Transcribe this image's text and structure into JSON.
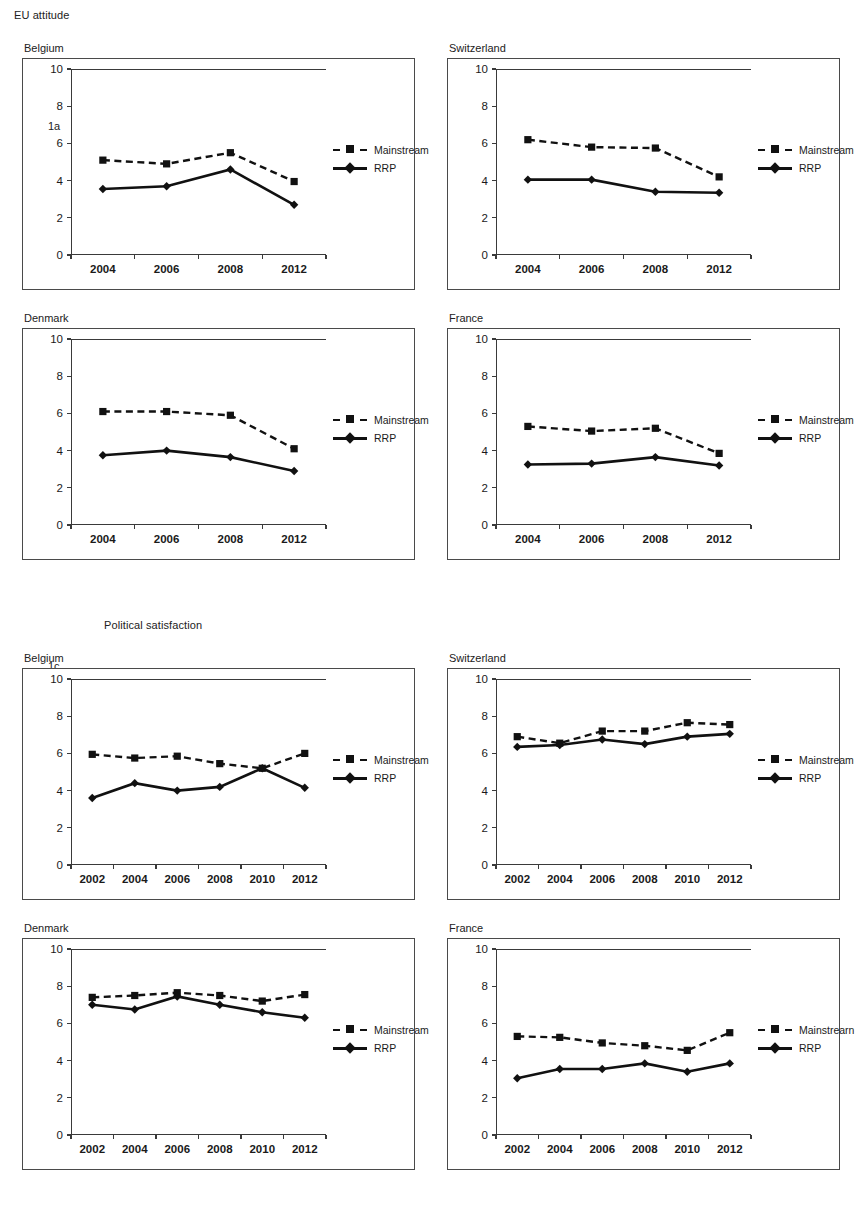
{
  "sections": [
    {
      "id": "eu-attitude",
      "title": "EU attitude"
    },
    {
      "id": "political-satisfaction",
      "title": "Political satisfaction"
    }
  ],
  "legend": {
    "mainstream_label": "Mainstream",
    "rrp_label": "RRP",
    "mainstream_label_variant": "Mainstrearn"
  },
  "axis": {
    "yticks": [
      "0",
      "2",
      "4",
      "6",
      "8",
      "10"
    ],
    "ymin": 0,
    "ymax": 10,
    "years_4": [
      "2004",
      "2006",
      "2008",
      "2012"
    ],
    "years_6": [
      "2002",
      "2004",
      "2006",
      "2008",
      "2010",
      "2012"
    ]
  },
  "panels": [
    {
      "tag": "1a",
      "country": "Belgium",
      "section": "EU attitude"
    },
    {
      "tag": "1b",
      "country": "Switzerland",
      "section": "EU attitude"
    },
    {
      "tag": "1c",
      "country": "Denmark",
      "section": "EU attitude"
    },
    {
      "tag": "1d",
      "country": "France",
      "section": "EU attitude"
    },
    {
      "tag": "2a",
      "country": "Belgium",
      "section": "Political satisfaction"
    },
    {
      "tag": "2b",
      "country": "Switzerland",
      "section": "Political satisfaction"
    },
    {
      "tag": "2c",
      "country": "Denmark",
      "section": "Political satisfaction"
    },
    {
      "tag": "2d",
      "country": "France",
      "section": "Political satisfaction"
    }
  ],
  "chart_data": [
    {
      "id": "1a",
      "type": "line",
      "title": "Belgium",
      "subtitle": "EU attitude",
      "categories": [
        "2004",
        "2006",
        "2008",
        "2012"
      ],
      "series": [
        {
          "name": "Mainstream",
          "values": [
            5.1,
            4.9,
            5.5,
            3.95
          ],
          "style": "dashed",
          "marker": "square"
        },
        {
          "name": "RRP",
          "values": [
            3.55,
            3.7,
            4.6,
            2.7
          ],
          "style": "solid",
          "marker": "diamond"
        }
      ],
      "xlabel": "",
      "ylabel": "",
      "ylim": [
        0,
        10
      ],
      "yticks": [
        0,
        2,
        4,
        6,
        8,
        10
      ],
      "grid": false,
      "legend_position": "right"
    },
    {
      "id": "1b",
      "type": "line",
      "title": "Switzerland",
      "subtitle": "EU attitude",
      "categories": [
        "2004",
        "2006",
        "2008",
        "2012"
      ],
      "series": [
        {
          "name": "Mainstream",
          "values": [
            6.2,
            5.8,
            5.75,
            4.2
          ],
          "style": "dashed",
          "marker": "square"
        },
        {
          "name": "RRP",
          "values": [
            4.05,
            4.05,
            3.4,
            3.35
          ],
          "style": "solid",
          "marker": "diamond"
        }
      ],
      "xlabel": "",
      "ylabel": "",
      "ylim": [
        0,
        10
      ],
      "yticks": [
        0,
        2,
        4,
        6,
        8,
        10
      ],
      "grid": false,
      "legend_position": "right"
    },
    {
      "id": "1c",
      "type": "line",
      "title": "Denmark",
      "subtitle": "EU attitude",
      "categories": [
        "2004",
        "2006",
        "2008",
        "2012"
      ],
      "series": [
        {
          "name": "Mainstream",
          "values": [
            6.1,
            6.1,
            5.9,
            4.1
          ],
          "style": "dashed",
          "marker": "square"
        },
        {
          "name": "RRP",
          "values": [
            3.75,
            4.0,
            3.65,
            2.9
          ],
          "style": "solid",
          "marker": "diamond"
        }
      ],
      "xlabel": "",
      "ylabel": "",
      "ylim": [
        0,
        10
      ],
      "yticks": [
        0,
        2,
        4,
        6,
        8,
        10
      ],
      "grid": false,
      "legend_position": "right"
    },
    {
      "id": "1d",
      "type": "line",
      "title": "France",
      "subtitle": "EU attitude",
      "categories": [
        "2004",
        "2006",
        "2008",
        "2012"
      ],
      "series": [
        {
          "name": "Mainstream",
          "values": [
            5.3,
            5.05,
            5.2,
            3.85
          ],
          "style": "dashed",
          "marker": "square"
        },
        {
          "name": "RRP",
          "values": [
            3.25,
            3.3,
            3.65,
            3.2
          ],
          "style": "solid",
          "marker": "diamond"
        }
      ],
      "xlabel": "",
      "ylabel": "",
      "ylim": [
        0,
        10
      ],
      "yticks": [
        0,
        2,
        4,
        6,
        8,
        10
      ],
      "grid": false,
      "legend_position": "right"
    },
    {
      "id": "2a",
      "type": "line",
      "title": "Belgium",
      "subtitle": "Political satisfaction",
      "categories": [
        "2002",
        "2004",
        "2006",
        "2008",
        "2010",
        "2012"
      ],
      "series": [
        {
          "name": "Mainstream",
          "values": [
            5.95,
            5.75,
            5.85,
            5.45,
            5.2,
            6.0
          ],
          "style": "dashed",
          "marker": "square"
        },
        {
          "name": "RRP",
          "values": [
            3.6,
            4.4,
            4.0,
            4.2,
            5.2,
            4.15
          ],
          "style": "solid",
          "marker": "diamond"
        }
      ],
      "xlabel": "",
      "ylabel": "",
      "ylim": [
        0,
        10
      ],
      "yticks": [
        0,
        2,
        4,
        6,
        8,
        10
      ],
      "grid": false,
      "legend_position": "right"
    },
    {
      "id": "2b",
      "type": "line",
      "title": "Switzerland",
      "subtitle": "Political satisfaction",
      "categories": [
        "2002",
        "2004",
        "2006",
        "2008",
        "2010",
        "2012"
      ],
      "series": [
        {
          "name": "Mainstream",
          "values": [
            6.9,
            6.55,
            7.2,
            7.2,
            7.65,
            7.55
          ],
          "style": "dashed",
          "marker": "square"
        },
        {
          "name": "RRP",
          "values": [
            6.35,
            6.45,
            6.75,
            6.5,
            6.9,
            7.05
          ],
          "style": "solid",
          "marker": "diamond"
        }
      ],
      "xlabel": "",
      "ylabel": "",
      "ylim": [
        0,
        10
      ],
      "yticks": [
        0,
        2,
        4,
        6,
        8,
        10
      ],
      "grid": false,
      "legend_position": "right"
    },
    {
      "id": "2c",
      "type": "line",
      "title": "Denmark",
      "subtitle": "Political satisfaction",
      "categories": [
        "2002",
        "2004",
        "2006",
        "2008",
        "2010",
        "2012"
      ],
      "series": [
        {
          "name": "Mainstream",
          "values": [
            7.4,
            7.5,
            7.65,
            7.5,
            7.2,
            7.55
          ],
          "style": "dashed",
          "marker": "square"
        },
        {
          "name": "RRP",
          "values": [
            7.0,
            6.75,
            7.45,
            7.0,
            6.6,
            6.3
          ],
          "style": "solid",
          "marker": "diamond"
        }
      ],
      "xlabel": "",
      "ylabel": "",
      "ylim": [
        0,
        10
      ],
      "yticks": [
        0,
        2,
        4,
        6,
        8,
        10
      ],
      "grid": false,
      "legend_position": "right"
    },
    {
      "id": "2d",
      "type": "line",
      "title": "France",
      "subtitle": "Political satisfaction",
      "categories": [
        "2002",
        "2004",
        "2006",
        "2008",
        "2010",
        "2012"
      ],
      "series": [
        {
          "name": "Mainstrearn",
          "values": [
            5.3,
            5.25,
            4.95,
            4.8,
            4.55,
            5.5
          ],
          "style": "dashed",
          "marker": "square"
        },
        {
          "name": "RRP",
          "values": [
            3.05,
            3.55,
            3.55,
            3.85,
            3.4,
            3.85
          ],
          "style": "solid",
          "marker": "diamond"
        }
      ],
      "xlabel": "",
      "ylabel": "",
      "ylim": [
        0,
        10
      ],
      "yticks": [
        0,
        2,
        4,
        6,
        8,
        10
      ],
      "grid": false,
      "legend_position": "right"
    }
  ],
  "layout": {
    "panel_boxes": {
      "1a": {
        "x": 22,
        "y": 58,
        "w": 393,
        "h": 232
      },
      "1b": {
        "x": 447,
        "y": 58,
        "w": 393,
        "h": 232
      },
      "1c": {
        "x": 22,
        "y": 328,
        "w": 393,
        "h": 232
      },
      "1d": {
        "x": 447,
        "y": 328,
        "w": 393,
        "h": 232
      },
      "2a": {
        "x": 22,
        "y": 668,
        "w": 393,
        "h": 232
      },
      "2b": {
        "x": 447,
        "y": 668,
        "w": 393,
        "h": 232
      },
      "2c": {
        "x": 22,
        "y": 938,
        "w": 393,
        "h": 232
      },
      "2d": {
        "x": 447,
        "y": 938,
        "w": 393,
        "h": 232
      }
    },
    "section_title_positions": {
      "eu-attitude": {
        "x": 14,
        "y": 10
      },
      "political-satisfaction": {
        "x": 104,
        "y": 620
      }
    }
  }
}
